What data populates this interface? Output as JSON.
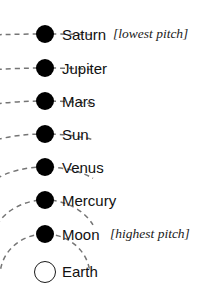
{
  "diagram": {
    "background_color": "#ffffff",
    "ink_color": "#000000",
    "arc_color": "#707070",
    "bodies": [
      {
        "name": "Saturn",
        "label": "Saturn",
        "order": 1,
        "marker": "filled-disc",
        "dot_cx": 45,
        "dot_cy": 34,
        "dot_r": 9,
        "label_x": 62,
        "label_y": 27,
        "arc_rx": 150,
        "arc_ry": 14,
        "arc_color": "#757575",
        "annotation": "[lowest pitch]",
        "annotation_x": 113,
        "annotation_y": 27
      },
      {
        "name": "Jupiter",
        "label": "Jupiter",
        "order": 2,
        "marker": "filled-disc",
        "dot_cx": 45,
        "dot_cy": 68,
        "dot_r": 9,
        "label_x": 62,
        "label_y": 61,
        "arc_rx": 120,
        "arc_ry": 18,
        "arc_color": "#757575",
        "annotation": "",
        "annotation_x": 0,
        "annotation_y": 0
      },
      {
        "name": "Mars",
        "label": "Mars",
        "order": 3,
        "marker": "filled-disc",
        "dot_cx": 45,
        "dot_cy": 101,
        "dot_r": 9,
        "label_x": 62,
        "label_y": 94,
        "arc_rx": 98,
        "arc_ry": 22,
        "arc_color": "#757575",
        "annotation": "",
        "annotation_x": 0,
        "annotation_y": 0
      },
      {
        "name": "Sun",
        "label": "Sun",
        "order": 4,
        "marker": "filled-disc",
        "dot_cx": 45,
        "dot_cy": 134,
        "dot_r": 9,
        "label_x": 62,
        "label_y": 127,
        "arc_rx": 80,
        "arc_ry": 28,
        "arc_color": "#757575",
        "annotation": "",
        "annotation_x": 0,
        "annotation_y": 0
      },
      {
        "name": "Venus",
        "label": "Venus",
        "order": 5,
        "marker": "filled-disc",
        "dot_cx": 45,
        "dot_cy": 167,
        "dot_r": 9,
        "label_x": 62,
        "label_y": 160,
        "arc_rx": 66,
        "arc_ry": 36,
        "arc_color": "#757575",
        "annotation": "",
        "annotation_x": 0,
        "annotation_y": 0
      },
      {
        "name": "Mercury",
        "label": "Mercury",
        "order": 6,
        "marker": "filled-disc",
        "dot_cx": 45,
        "dot_cy": 200,
        "dot_r": 9,
        "label_x": 62,
        "label_y": 193,
        "arc_rx": 54,
        "arc_ry": 46,
        "arc_color": "#757575",
        "annotation": "",
        "annotation_x": 0,
        "annotation_y": 0
      },
      {
        "name": "Moon",
        "label": "Moon",
        "order": 7,
        "marker": "filled-disc",
        "dot_cx": 45,
        "dot_cy": 234,
        "dot_r": 9,
        "label_x": 62,
        "label_y": 227,
        "arc_rx": 45,
        "arc_ry": 42,
        "arc_color": "#757575",
        "annotation": "[highest pitch]",
        "annotation_x": 110,
        "annotation_y": 227
      },
      {
        "name": "Earth",
        "label": "Earth",
        "order": 8,
        "marker": "hollow-circle",
        "dot_cx": 45,
        "dot_cy": 272,
        "dot_r": 11,
        "label_x": 62,
        "label_y": 264,
        "arc_rx": 0,
        "arc_ry": 0,
        "arc_color": "#757575",
        "annotation": "",
        "annotation_x": 0,
        "annotation_y": 0
      }
    ]
  }
}
